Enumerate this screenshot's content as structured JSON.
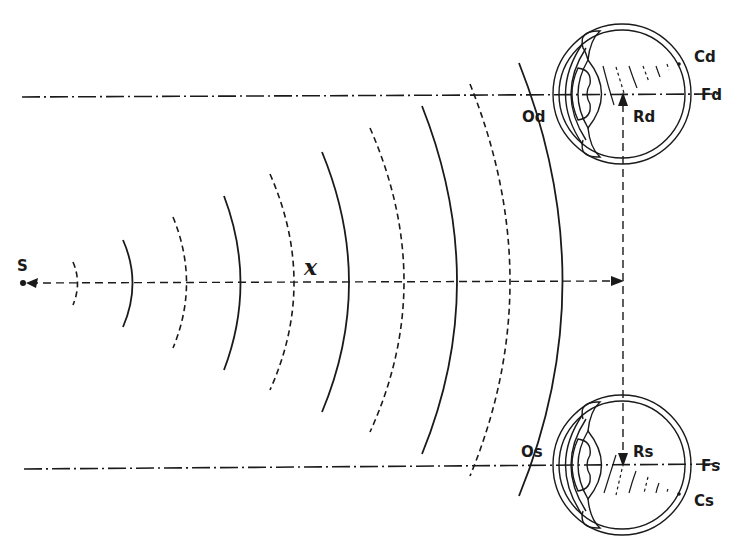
{
  "figure": {
    "type": "optics-diagram"
  },
  "labels": {
    "source": "S",
    "distance": "x",
    "right_eye_optical_center": "Od",
    "right_eye_retina_point": "Rd",
    "right_eye_fovea": "Fd",
    "right_eye_c_point": "Cd",
    "left_eye_optical_center": "Os",
    "left_eye_retina_point": "Rs",
    "left_eye_fovea": "Fs",
    "left_eye_c_point": "Cs"
  },
  "geometry": {
    "source_point": [
      22,
      283
    ],
    "main_axis_y": 283,
    "right_eye": {
      "center": [
        622,
        94
      ],
      "rx": 68,
      "ry": 69,
      "axis_y": 94
    },
    "left_eye": {
      "center": [
        622,
        465
      ],
      "rx": 68,
      "ry": 70,
      "axis_y": 465
    },
    "vertical_ray_x": 623,
    "wavefronts": [
      {
        "apex_x": 78,
        "half_height": 22,
        "style": "dashed"
      },
      {
        "apex_x": 132,
        "half_height": 44,
        "style": "solid"
      },
      {
        "apex_x": 186,
        "half_height": 66,
        "style": "dashed"
      },
      {
        "apex_x": 240,
        "half_height": 87,
        "style": "solid"
      },
      {
        "apex_x": 294,
        "half_height": 108,
        "style": "dashed"
      },
      {
        "apex_x": 349,
        "half_height": 130,
        "style": "solid"
      },
      {
        "apex_x": 403,
        "half_height": 153,
        "style": "dashed"
      },
      {
        "apex_x": 456,
        "half_height": 176,
        "style": "solid"
      },
      {
        "apex_x": 510,
        "half_height": 197,
        "style": "dashed"
      },
      {
        "apex_x": 563,
        "half_height": 220,
        "style": "solid"
      }
    ]
  }
}
